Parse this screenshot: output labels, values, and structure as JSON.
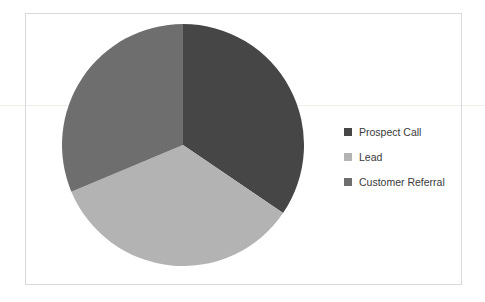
{
  "chart_data": {
    "type": "pie",
    "title": "",
    "subtitle": "",
    "categories": [
      "Prospect Call",
      "Lead",
      "Customer Referral"
    ],
    "values": [
      34.5,
      34.2,
      31.3
    ],
    "units": "percent",
    "slice_angles_deg": [
      124,
      123,
      113
    ],
    "start_angle_deg": 0,
    "direction": "clockwise",
    "colors": [
      "#464646",
      "#b3b3b3",
      "#6e6e6e"
    ],
    "legend_position": "right",
    "grid": false,
    "labels_shown": false,
    "series": [
      {
        "name": "Lead Source",
        "points": [
          {
            "label": "Prospect Call",
            "value": 34.5,
            "color": "#464646",
            "angle_deg": 124
          },
          {
            "label": "Lead",
            "value": 34.2,
            "color": "#b3b3b3",
            "angle_deg": 123
          },
          {
            "label": "Customer Referral",
            "value": 31.3,
            "color": "#6e6e6e",
            "angle_deg": 113
          }
        ]
      }
    ],
    "xlabel": "",
    "ylabel": ""
  },
  "legend": {
    "items": [
      {
        "label": "Prospect Call",
        "color": "#464646"
      },
      {
        "label": "Lead",
        "color": "#b3b3b3"
      },
      {
        "label": "Customer Referral",
        "color": "#6e6e6e"
      }
    ]
  },
  "frame": {
    "border_color": "#d9d9d9",
    "background": "#ffffff"
  }
}
